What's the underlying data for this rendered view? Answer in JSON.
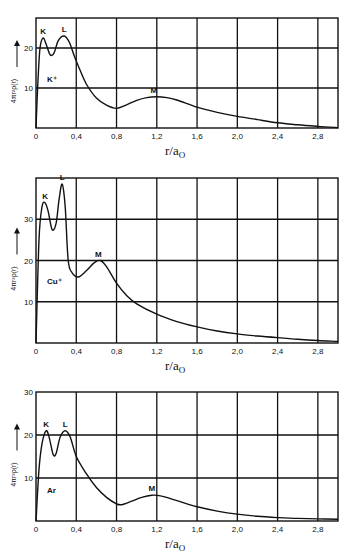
{
  "chart_data": [
    {
      "type": "line",
      "title": "",
      "ion_label": "K⁺",
      "xlabel": "r/a₀",
      "ylabel": "4πr²ρ(r)",
      "xlim": [
        0,
        3.0
      ],
      "ylim": [
        0,
        27.5
      ],
      "grid": true,
      "xticks": [
        "0",
        "0,4",
        "0,8",
        "1,2",
        "1,6",
        "2,0",
        "2,4",
        "2,8"
      ],
      "yticks": [
        "10",
        "20"
      ],
      "peak_labels": [
        {
          "label": "K",
          "x": 0.07,
          "y": 22.5
        },
        {
          "label": "L",
          "x": 0.28,
          "y": 23
        },
        {
          "label": "M",
          "x": 1.17,
          "y": 7.8
        }
      ],
      "x": [
        0,
        0.02,
        0.04,
        0.07,
        0.1,
        0.14,
        0.18,
        0.22,
        0.28,
        0.33,
        0.38,
        0.42,
        0.5,
        0.6,
        0.7,
        0.8,
        0.9,
        1.0,
        1.1,
        1.2,
        1.3,
        1.4,
        1.6,
        1.8,
        2.0,
        2.2,
        2.4,
        2.6,
        2.8,
        3.0
      ],
      "y": [
        0,
        12,
        20,
        22.5,
        21,
        18.3,
        18.8,
        21.8,
        23,
        21.5,
        18,
        15.5,
        11,
        7.5,
        5.7,
        4.9,
        5.8,
        6.9,
        7.6,
        7.8,
        7.6,
        7.0,
        5.2,
        3.9,
        2.9,
        2.1,
        1.3,
        0.8,
        0.4,
        0.1
      ]
    },
    {
      "type": "line",
      "title": "",
      "ion_label": "Cu⁺",
      "xlabel": "r/a₀",
      "ylabel": "4πr²ρ(r)",
      "xlim": [
        0,
        3.0
      ],
      "ylim": [
        0,
        40
      ],
      "grid": true,
      "xticks": [
        "0",
        "0,4",
        "0,8",
        "1,2",
        "1,6",
        "2,0",
        "2,4",
        "2,8"
      ],
      "yticks": [
        "10",
        "20",
        "30"
      ],
      "peak_labels": [
        {
          "label": "K",
          "x": 0.09,
          "y": 34
        },
        {
          "label": "L",
          "x": 0.26,
          "y": 38.5
        },
        {
          "label": "M",
          "x": 0.62,
          "y": 20
        }
      ],
      "x": [
        0,
        0.03,
        0.06,
        0.09,
        0.12,
        0.16,
        0.2,
        0.23,
        0.26,
        0.29,
        0.32,
        0.36,
        0.42,
        0.5,
        0.58,
        0.64,
        0.7,
        0.8,
        0.9,
        1.0,
        1.2,
        1.4,
        1.6,
        1.8,
        2.0,
        2.2,
        2.4,
        2.6,
        2.8,
        3.0
      ],
      "y": [
        0,
        25,
        33,
        34,
        32,
        27.5,
        29,
        35,
        38.5,
        33,
        20,
        17,
        16,
        17.5,
        19.5,
        20,
        18.5,
        14.5,
        11.5,
        9.5,
        7,
        5.2,
        3.9,
        2.9,
        2.2,
        1.7,
        1.3,
        0.9,
        0.6,
        0.4
      ]
    },
    {
      "type": "line",
      "title": "",
      "ion_label": "Ar",
      "xlabel": "r/a₀",
      "ylabel": "4πr²ρ(r)",
      "xlim": [
        0,
        3.0
      ],
      "ylim": [
        0,
        30
      ],
      "grid": true,
      "xticks": [
        "0",
        "0,4",
        "0,8",
        "1,2",
        "1,6",
        "2,0",
        "2,4",
        "2,8"
      ],
      "yticks": [
        "10",
        "20",
        "30"
      ],
      "peak_labels": [
        {
          "label": "K",
          "x": 0.1,
          "y": 21
        },
        {
          "label": "L",
          "x": 0.29,
          "y": 21
        },
        {
          "label": "M",
          "x": 1.15,
          "y": 6
        }
      ],
      "x": [
        0,
        0.03,
        0.06,
        0.1,
        0.13,
        0.17,
        0.2,
        0.24,
        0.29,
        0.34,
        0.4,
        0.5,
        0.6,
        0.7,
        0.8,
        0.85,
        0.95,
        1.05,
        1.15,
        1.25,
        1.35,
        1.5,
        1.6,
        1.8,
        2.0,
        2.2,
        2.4,
        2.6,
        2.8,
        3.0
      ],
      "y": [
        0,
        12,
        18,
        21,
        19.5,
        15.5,
        15.7,
        19.5,
        21,
        19.5,
        15,
        11,
        7.8,
        5.5,
        4,
        3.8,
        4.6,
        5.5,
        6,
        5.8,
        5.1,
        4,
        3.3,
        2.3,
        1.6,
        1.1,
        0.8,
        0.6,
        0.5,
        0.4
      ]
    }
  ]
}
